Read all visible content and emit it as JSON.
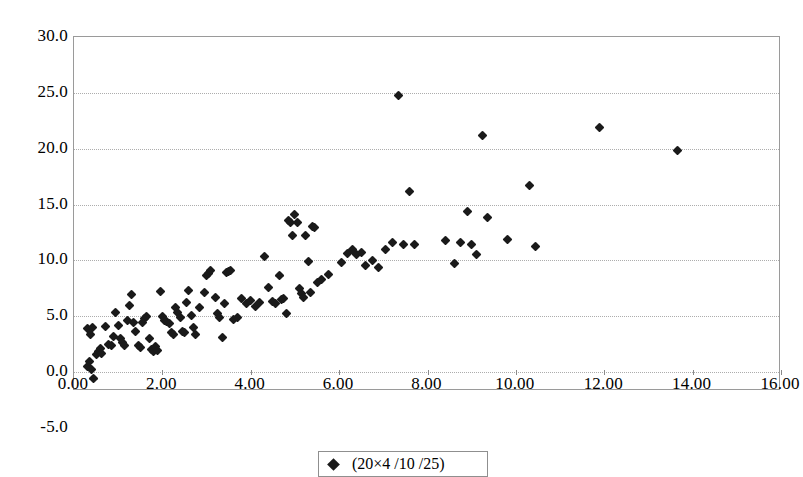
{
  "chart_data": {
    "type": "scatter",
    "title": "",
    "subtitle": "",
    "xlabel": "",
    "ylabel": "",
    "xlim": [
      0,
      16
    ],
    "ylim": [
      -5,
      30
    ],
    "xticks": [
      "0.00",
      "2.00",
      "4.00",
      "6.00",
      "8.00",
      "10.00",
      "12.00",
      "14.00",
      "16.00"
    ],
    "xtick_values": [
      0,
      2,
      4,
      6,
      8,
      10,
      12,
      14,
      16
    ],
    "yticks": [
      "30.0",
      "25.0",
      "20.0",
      "15.0",
      "10.0",
      "5.0",
      "0.0",
      "-5.0"
    ],
    "ytick_values": [
      30,
      25,
      20,
      15,
      10,
      5,
      0,
      -5
    ],
    "gridlines": {
      "horizontal_at": [
        25,
        20,
        15,
        10,
        5,
        0
      ],
      "vertical": false
    },
    "legend_position": "bottom-center",
    "marker": "diamond",
    "marker_color": "#1a1a1a",
    "series": [
      {
        "name": "data",
        "points": [
          [
            0.3,
            3.9
          ],
          [
            0.38,
            3.4
          ],
          [
            0.42,
            4.0
          ],
          [
            0.3,
            0.5
          ],
          [
            0.34,
            0.9
          ],
          [
            0.4,
            0.2
          ],
          [
            0.45,
            -0.6
          ],
          [
            0.5,
            1.6
          ],
          [
            0.55,
            1.8
          ],
          [
            0.6,
            2.1
          ],
          [
            0.62,
            1.7
          ],
          [
            0.72,
            4.1
          ],
          [
            0.78,
            2.5
          ],
          [
            0.85,
            2.4
          ],
          [
            0.9,
            3.2
          ],
          [
            0.95,
            5.3
          ],
          [
            1.0,
            4.2
          ],
          [
            1.05,
            3.0
          ],
          [
            1.1,
            2.6
          ],
          [
            1.15,
            2.4
          ],
          [
            1.2,
            4.6
          ],
          [
            1.25,
            6.0
          ],
          [
            1.3,
            6.9
          ],
          [
            1.35,
            4.4
          ],
          [
            1.4,
            3.6
          ],
          [
            1.45,
            2.4
          ],
          [
            1.5,
            2.2
          ],
          [
            1.55,
            4.4
          ],
          [
            1.6,
            4.8
          ],
          [
            1.65,
            5.0
          ],
          [
            1.7,
            3.0
          ],
          [
            1.75,
            2.0
          ],
          [
            1.8,
            1.8
          ],
          [
            1.85,
            2.3
          ],
          [
            1.9,
            1.9
          ],
          [
            1.95,
            7.2
          ],
          [
            2.0,
            5.0
          ],
          [
            2.05,
            4.6
          ],
          [
            2.1,
            4.5
          ],
          [
            2.15,
            4.3
          ],
          [
            2.2,
            3.5
          ],
          [
            2.25,
            3.4
          ],
          [
            2.3,
            5.8
          ],
          [
            2.35,
            5.3
          ],
          [
            2.4,
            4.9
          ],
          [
            2.45,
            3.6
          ],
          [
            2.5,
            3.5
          ],
          [
            2.55,
            6.2
          ],
          [
            2.6,
            7.3
          ],
          [
            2.65,
            5.1
          ],
          [
            2.7,
            4.0
          ],
          [
            2.75,
            3.4
          ],
          [
            2.85,
            5.8
          ],
          [
            2.95,
            7.1
          ],
          [
            3.0,
            8.6
          ],
          [
            3.05,
            8.8
          ],
          [
            3.1,
            9.1
          ],
          [
            3.2,
            6.7
          ],
          [
            3.25,
            5.2
          ],
          [
            3.3,
            4.9
          ],
          [
            3.35,
            3.1
          ],
          [
            3.4,
            6.1
          ],
          [
            3.45,
            8.9
          ],
          [
            3.5,
            9.0
          ],
          [
            3.55,
            9.1
          ],
          [
            3.6,
            4.7
          ],
          [
            3.7,
            4.9
          ],
          [
            3.8,
            6.6
          ],
          [
            3.9,
            6.1
          ],
          [
            4.0,
            6.4
          ],
          [
            4.1,
            5.9
          ],
          [
            4.2,
            6.2
          ],
          [
            4.3,
            10.3
          ],
          [
            4.4,
            7.6
          ],
          [
            4.5,
            6.3
          ],
          [
            4.55,
            6.1
          ],
          [
            4.65,
            8.6
          ],
          [
            4.7,
            6.5
          ],
          [
            4.75,
            6.6
          ],
          [
            4.8,
            5.2
          ],
          [
            4.85,
            13.6
          ],
          [
            4.9,
            13.4
          ],
          [
            4.95,
            12.2
          ],
          [
            5.0,
            14.1
          ],
          [
            5.05,
            13.4
          ],
          [
            5.1,
            7.5
          ],
          [
            5.15,
            7.0
          ],
          [
            5.2,
            6.7
          ],
          [
            5.25,
            12.2
          ],
          [
            5.3,
            9.9
          ],
          [
            5.35,
            7.1
          ],
          [
            5.4,
            13.0
          ],
          [
            5.45,
            12.9
          ],
          [
            5.5,
            8.0
          ],
          [
            5.6,
            8.3
          ],
          [
            5.75,
            8.7
          ],
          [
            6.05,
            9.8
          ],
          [
            6.2,
            10.6
          ],
          [
            6.3,
            11.0
          ],
          [
            6.4,
            10.5
          ],
          [
            6.5,
            10.7
          ],
          [
            6.6,
            9.5
          ],
          [
            6.75,
            10.0
          ],
          [
            6.9,
            9.4
          ],
          [
            7.05,
            11.0
          ],
          [
            7.2,
            11.6
          ],
          [
            7.35,
            24.8
          ],
          [
            7.45,
            11.4
          ],
          [
            7.6,
            16.2
          ],
          [
            7.7,
            11.4
          ],
          [
            8.4,
            11.8
          ],
          [
            8.6,
            9.7
          ],
          [
            8.75,
            11.6
          ],
          [
            8.9,
            14.4
          ],
          [
            9.0,
            11.4
          ],
          [
            9.1,
            10.5
          ],
          [
            9.25,
            21.2
          ],
          [
            9.35,
            13.8
          ],
          [
            9.8,
            11.9
          ],
          [
            10.3,
            16.7
          ],
          [
            10.45,
            11.2
          ],
          [
            11.9,
            21.9
          ],
          [
            13.65,
            19.8
          ]
        ]
      }
    ]
  },
  "legend": {
    "marker_label": "data",
    "entry_text": "(20×4 /10 /25)"
  }
}
